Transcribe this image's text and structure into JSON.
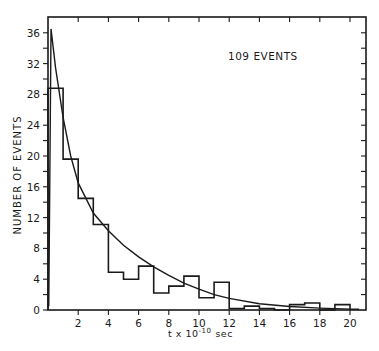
{
  "chart_data": {
    "type": "bar",
    "subtype": "histogram_with_fit_curve",
    "title": "",
    "annotation": "109 EVENTS",
    "xlabel": "t x 10",
    "xlabel_exponent": "-10",
    "xlabel_unit": "sec",
    "ylabel": "NUMBER OF EVENTS",
    "xlim": [
      0,
      21
    ],
    "ylim": [
      0,
      38
    ],
    "x_ticks": [
      2,
      4,
      6,
      8,
      10,
      12,
      14,
      16,
      18,
      20
    ],
    "y_ticks": [
      0,
      4,
      8,
      12,
      16,
      20,
      24,
      28,
      32,
      36
    ],
    "grid": false,
    "bin_edges": [
      0,
      1,
      2,
      3,
      4,
      5,
      6,
      7,
      8,
      9,
      10,
      11,
      12,
      13,
      14,
      15,
      16,
      17,
      18,
      19,
      20
    ],
    "categories": [
      "0-1",
      "1-2",
      "2-3",
      "3-4",
      "4-5",
      "5-6",
      "6-7",
      "7-8",
      "8-9",
      "9-10",
      "10-11",
      "11-12",
      "12-13",
      "13-14",
      "14-15",
      "15-16",
      "16-17",
      "17-18",
      "18-19",
      "19-20"
    ],
    "values": [
      28.8,
      19.6,
      14.5,
      11.1,
      4.9,
      4.0,
      5.7,
      2.2,
      3.1,
      4.4,
      1.6,
      3.6,
      0.2,
      0.5,
      0.2,
      0.0,
      0.7,
      0.9,
      0.0,
      0.7
    ],
    "series": [
      {
        "name": "histogram",
        "values": [
          28.8,
          19.6,
          14.5,
          11.1,
          4.9,
          4.0,
          5.7,
          2.2,
          3.1,
          4.4,
          1.6,
          3.6,
          0.2,
          0.5,
          0.2,
          0.0,
          0.7,
          0.9,
          0.0,
          0.7
        ]
      },
      {
        "name": "fit curve",
        "x": [
          0.2,
          0.5,
          1,
          1.5,
          2,
          3,
          4,
          5,
          6,
          7,
          8,
          9,
          10,
          11,
          12,
          14,
          16,
          18,
          20,
          20.6
        ],
        "values": [
          36.5,
          31.5,
          25,
          20,
          16.5,
          12.6,
          10.3,
          8.4,
          6.9,
          5.6,
          4.5,
          3.5,
          2.7,
          2.0,
          1.5,
          0.8,
          0.45,
          0.25,
          0.12,
          0.1
        ]
      }
    ]
  }
}
